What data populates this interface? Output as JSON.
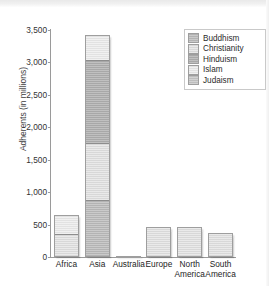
{
  "chart_data": {
    "type": "bar",
    "subtype": "stacked",
    "title": "",
    "xlabel": "",
    "ylabel": "Adherents (in millions)",
    "ylim": [
      0,
      3500
    ],
    "yticks": [
      0,
      500,
      1000,
      1500,
      2000,
      2500,
      3000,
      3500
    ],
    "ytick_labels": [
      "0",
      "500",
      "1,000",
      "1,500",
      "2,000",
      "2,500",
      "3,000",
      "3,500"
    ],
    "grid": false,
    "legend_position": "top-right",
    "categories": [
      "Africa",
      "Asia",
      "Australia",
      "Europe",
      "North America",
      "South America"
    ],
    "series": [
      {
        "name": "Buddhism",
        "color": "#b3b3b3",
        "values": [
          0,
          880,
          0,
          0,
          0,
          0
        ]
      },
      {
        "name": "Christianity",
        "color": "#d8d8d8",
        "values": [
          350,
          870,
          15,
          470,
          465,
          370
        ]
      },
      {
        "name": "Hinduism",
        "color": "#a8a8a8",
        "values": [
          0,
          1280,
          0,
          0,
          0,
          0
        ]
      },
      {
        "name": "Islam",
        "color": "#e2e2e2",
        "values": [
          300,
          400,
          5,
          0,
          0,
          0
        ]
      },
      {
        "name": "Judaism",
        "color": "#bdbdbd",
        "values": [
          0,
          0,
          0,
          0,
          0,
          0
        ]
      }
    ],
    "totals": [
      650,
      3430,
      20,
      470,
      465,
      370
    ]
  },
  "axis": {
    "y_title": "Adherents (in millions)"
  },
  "legend": {
    "items": [
      {
        "label": "Buddhism"
      },
      {
        "label": "Christianity"
      },
      {
        "label": "Hinduism"
      },
      {
        "label": "Islam"
      },
      {
        "label": "Judaism"
      }
    ]
  }
}
